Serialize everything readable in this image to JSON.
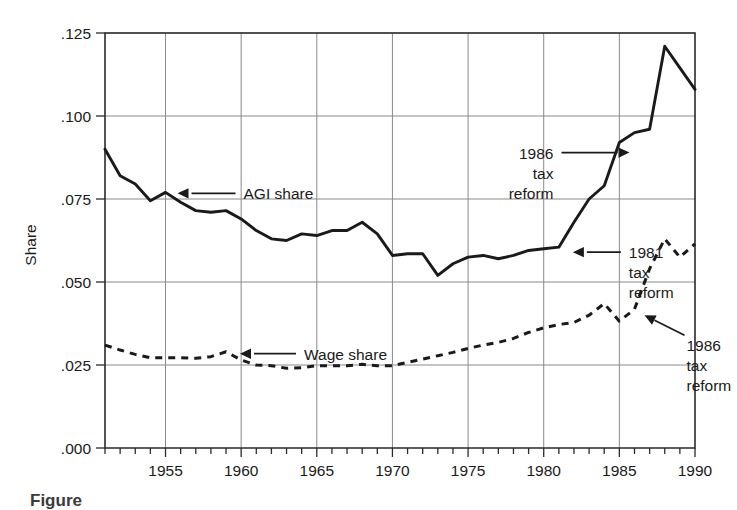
{
  "chart_data": {
    "type": "line",
    "title": "",
    "xlabel": "",
    "ylabel": "Share",
    "xlim": [
      1951,
      1990
    ],
    "ylim": [
      0.0,
      0.125
    ],
    "grid": true,
    "legend_position": "inline-annotations",
    "y_ticks": [
      ".000",
      ".025",
      ".050",
      ".075",
      ".100",
      ".125"
    ],
    "y_tick_values": [
      0.0,
      0.025,
      0.05,
      0.075,
      0.1,
      0.125
    ],
    "x_ticks": [
      "1955",
      "1960",
      "1965",
      "1970",
      "1975",
      "1980",
      "1985",
      "1990"
    ],
    "x_tick_values": [
      1955,
      1960,
      1965,
      1970,
      1975,
      1980,
      1985,
      1990
    ],
    "x_minor_tick_interval": 1,
    "x": [
      1951,
      1952,
      1953,
      1954,
      1955,
      1956,
      1957,
      1958,
      1959,
      1960,
      1961,
      1962,
      1963,
      1964,
      1965,
      1966,
      1967,
      1968,
      1969,
      1970,
      1971,
      1972,
      1973,
      1974,
      1975,
      1976,
      1977,
      1978,
      1979,
      1980,
      1981,
      1982,
      1983,
      1984,
      1985,
      1986,
      1987,
      1988,
      1989,
      1990
    ],
    "series": [
      {
        "name": "AGI share",
        "style": "solid",
        "values": [
          0.09,
          0.082,
          0.0795,
          0.0745,
          0.077,
          0.074,
          0.0715,
          0.071,
          0.0715,
          0.069,
          0.0655,
          0.063,
          0.0625,
          0.0645,
          0.064,
          0.0655,
          0.0655,
          0.068,
          0.0645,
          0.058,
          0.0585,
          0.0585,
          0.052,
          0.0555,
          0.0575,
          0.058,
          0.057,
          0.058,
          0.0595,
          0.06,
          0.0605,
          0.068,
          0.075,
          0.079,
          0.092,
          0.095,
          0.096,
          0.121,
          0.1145,
          0.108
        ]
      },
      {
        "name": "Wage share",
        "style": "dashed",
        "values": [
          0.031,
          0.0295,
          0.0282,
          0.0272,
          0.0272,
          0.0272,
          0.027,
          0.0275,
          0.029,
          0.0265,
          0.025,
          0.0248,
          0.024,
          0.0242,
          0.0248,
          0.0248,
          0.0248,
          0.0252,
          0.0248,
          0.0248,
          0.0258,
          0.0268,
          0.0278,
          0.0288,
          0.03,
          0.031,
          0.0318,
          0.033,
          0.0348,
          0.0362,
          0.0372,
          0.0378,
          0.04,
          0.0435,
          0.0382,
          0.0418,
          0.054,
          0.063,
          0.0575,
          0.0615
        ]
      }
    ],
    "annotations": [
      {
        "id": "agi-share",
        "label": "AGI share",
        "lines": [
          "AGI share"
        ],
        "arrow": "left",
        "points_to_year": 1955,
        "points_to_value": 0.077
      },
      {
        "id": "wage-share",
        "label": "Wage share",
        "lines": [
          "Wage share"
        ],
        "arrow": "left",
        "points_to_year": 1959,
        "points_to_value": 0.029
      },
      {
        "id": "tax-reform-1986-upper",
        "label": "1986 tax reform",
        "lines": [
          "1986",
          "tax",
          "reform"
        ],
        "arrow": "right",
        "points_to_year": 1986,
        "points_to_value": 0.095
      },
      {
        "id": "tax-reform-1981",
        "label": "1981 tax reform",
        "lines": [
          "1981",
          "tax",
          "reform"
        ],
        "arrow": "left",
        "points_to_year": 1981,
        "points_to_value": 0.0605
      },
      {
        "id": "tax-reform-1986-lower",
        "label": "1986 tax reform",
        "lines": [
          "1986",
          "tax",
          "reform"
        ],
        "arrow": "up-left",
        "points_to_year": 1986,
        "points_to_value": 0.0418
      }
    ]
  },
  "caption": {
    "text": "Figure"
  }
}
